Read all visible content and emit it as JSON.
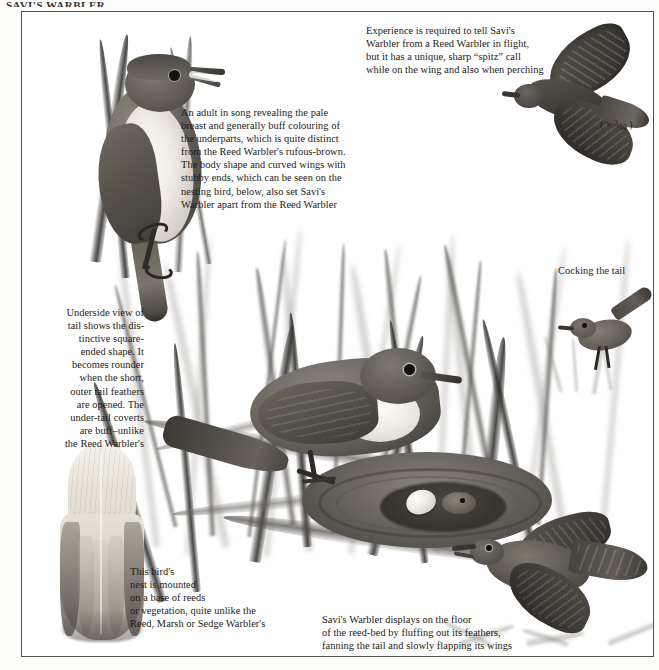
{
  "page": {
    "header_remnant": "SAVI'S WARBLER",
    "frame_color": "#55504b",
    "background_color": "#ffffff",
    "text_color": "#1d1a17"
  },
  "captions": {
    "flight": "Experience is required to tell Savi's\nWarbler from a Reed Warbler in flight,\nbut it has a unique, sharp “spitz” call\nwhile on the wing and also when perching",
    "adult_in_song": "An adult in song revealing the pale\nbreast and generally buff colouring of\nthe underparts, which is quite distinct\nfrom the Reed Warbler's rufous-brown.\nThe body shape and curved wings with\nstubby ends, which can be seen on the\nnesting bird, below, also set Savi's\nWarbler apart from the Reed Warbler",
    "underside_tail": "Underside view of\ntail shows the dis-\ntinctive square-\nended shape. It\nbecomes rounder\nwhen the short,\nouter tail feathers\nare opened. The\nunder-tail coverts\nare buff–unlike\nthe Reed Warbler's",
    "cocking_tail": "Cocking the tail",
    "nest": "This bird's\nnest is mounted\non a base of reeds\nor vegetation, quite unlike the\nReed, Marsh or Sedge Warbler's",
    "display": "Savi's Warbler displays on the floor\nof the reed-bed by fluffing out its feathers,\nfanning the tail and slowly flapping its wings"
  },
  "scale": {
    "prefix": "( × ",
    "numerator": "3",
    "denominator": "10",
    "suffix": " )"
  },
  "illustrations": {
    "singing_adult": "perched-warbler-singing-on-reed-stem",
    "flying_bird": "warbler-in-flight-from-below",
    "nesting_bird": "warbler-at-nest-with-eggs-and-chick",
    "tail_underside": "spread-tail-underside-specimen",
    "cocking_bird": "small-warbler-cocking-tail-on-reeds",
    "displaying_bird": "warbler-displaying-on-reed-bed-floor"
  }
}
